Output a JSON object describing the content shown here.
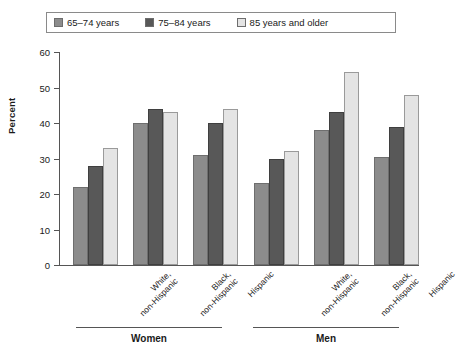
{
  "legend": {
    "items": [
      {
        "label": "65–74 years",
        "color": "#8c8c8c",
        "icon": "legend-swatch-icon"
      },
      {
        "label": "75–84 years",
        "color": "#585858",
        "icon": "legend-swatch-icon"
      },
      {
        "label": "85 years and older",
        "color": "#e4e4e4",
        "icon": "legend-swatch-icon"
      }
    ]
  },
  "axes": {
    "ylabel": "Percent",
    "yticks": [
      "0",
      "10",
      "20",
      "30",
      "40",
      "50",
      "60"
    ]
  },
  "categories": [
    {
      "line1": "White,",
      "line2": "non-Hispanic"
    },
    {
      "line1": "Black,",
      "line2": "non-Hispanic"
    },
    {
      "line1": "Hispanic",
      "line2": ""
    },
    {
      "line1": "White,",
      "line2": "non-Hispanic"
    },
    {
      "line1": "Black,",
      "line2": "non-Hispanic"
    },
    {
      "line1": "Hispanic",
      "line2": ""
    }
  ],
  "groups": [
    {
      "name": "Women"
    },
    {
      "name": "Men"
    }
  ],
  "chart_data": {
    "type": "bar",
    "title": "",
    "xlabel": "",
    "ylabel": "Percent",
    "ylim": [
      0,
      60
    ],
    "yticks": [
      0,
      10,
      20,
      30,
      40,
      50,
      60
    ],
    "grid": false,
    "legend_position": "top",
    "categories": [
      "Women – White, non-Hispanic",
      "Women – Black, non-Hispanic",
      "Women – Hispanic",
      "Men – White, non-Hispanic",
      "Men – Black, non-Hispanic",
      "Men – Hispanic"
    ],
    "series": [
      {
        "name": "65–74 years",
        "color": "#8c8c8c",
        "values": [
          22,
          40,
          31,
          23,
          38,
          30.5
        ]
      },
      {
        "name": "75–84 years",
        "color": "#585858",
        "values": [
          28,
          44,
          40,
          30,
          43,
          39
        ]
      },
      {
        "name": "85 years and older",
        "color": "#e4e4e4",
        "values": [
          33,
          43,
          44,
          32,
          54.5,
          48
        ]
      }
    ]
  }
}
